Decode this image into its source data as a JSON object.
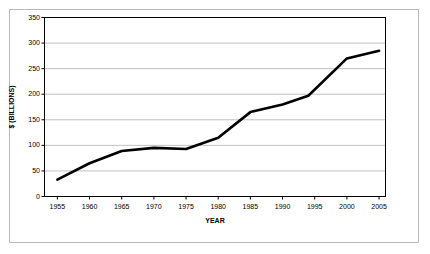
{
  "chart_data": {
    "type": "line",
    "title": "",
    "xlabel": "YEAR",
    "ylabel": "$ (BILLIONS)",
    "xlim": [
      1953,
      2006
    ],
    "ylim": [
      0,
      350
    ],
    "grid": "horizontal",
    "legend": "none",
    "line_color": "#000000",
    "plot_background": "#ffffff",
    "gridline_color": "#c0c0c0",
    "axis_color": "#000000",
    "frame_color": "#b9b9b9",
    "xticks": [
      "1955",
      "1960",
      "1965",
      "1970",
      "1975",
      "1980",
      "1985",
      "1990",
      "1995",
      "2000",
      "2005"
    ],
    "yticks": [
      "0",
      "50",
      "100",
      "150",
      "200",
      "250",
      "300",
      "350"
    ],
    "x": [
      1955,
      1960,
      1965,
      1970,
      1975,
      1980,
      1985,
      1990,
      1994,
      2000,
      2005
    ],
    "values": [
      33,
      65,
      89,
      95,
      93,
      115,
      165,
      180,
      197,
      270,
      285
    ],
    "series": [
      {
        "name": "",
        "values": [
          33,
          65,
          89,
          95,
          93,
          115,
          165,
          180,
          197,
          270,
          285
        ]
      }
    ]
  }
}
